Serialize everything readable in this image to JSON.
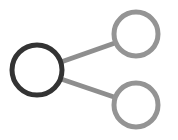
{
  "canvas": {
    "width": 178,
    "height": 140,
    "background_color": "#ffffff"
  },
  "icon": {
    "name": "share-network-icon",
    "description": "Share icon: one dark source node on the left connected by two straight lines to two lighter gray target nodes on the right",
    "node_count": 3,
    "link_count": 2
  },
  "colors": {
    "source_node_stroke": "#333333",
    "target_node_stroke": "#949494",
    "link_stroke": "#8e8e8e",
    "node_fill": "#ffffff"
  },
  "graph": {
    "nodes": [
      {
        "id": "source",
        "label": "source-node",
        "cx": 37,
        "cy": 70,
        "r": 25,
        "stroke_width": 5,
        "stroke_color": "#333333",
        "fill": "#ffffff",
        "state": "selected"
      },
      {
        "id": "target-top",
        "label": "target-node-top",
        "cx": 136,
        "cy": 34,
        "r": 22,
        "stroke_width": 5,
        "stroke_color": "#949494",
        "fill": "#ffffff",
        "state": "default"
      },
      {
        "id": "target-bottom",
        "label": "target-node-bottom",
        "cx": 136,
        "cy": 105,
        "r": 22,
        "stroke_width": 5,
        "stroke_color": "#949494",
        "fill": "#ffffff",
        "state": "default"
      }
    ],
    "links": [
      {
        "id": "link-top",
        "label": "link-source-to-top",
        "from": "source",
        "to": "target-top",
        "x1": 61,
        "y1": 62,
        "x2": 115,
        "y2": 43,
        "stroke_width": 5,
        "stroke_color": "#8e8e8e"
      },
      {
        "id": "link-bottom",
        "label": "link-source-to-bottom",
        "from": "source",
        "to": "target-bottom",
        "x1": 61,
        "y1": 79,
        "x2": 114,
        "y2": 97,
        "stroke_width": 5,
        "stroke_color": "#8e8e8e"
      }
    ]
  }
}
